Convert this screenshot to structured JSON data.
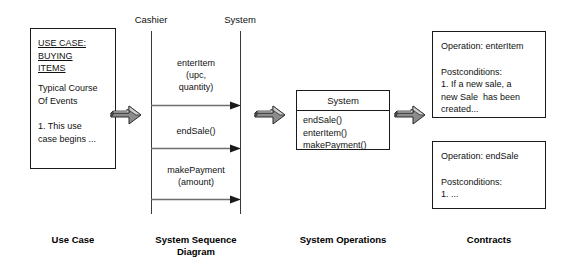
{
  "diagram": {
    "colors": {
      "stroke": "#1a1a1a",
      "lifeline": "#3a3a3a",
      "arrow_body": "#808080",
      "arrow_top": "#c8c8c8",
      "arrow_side": "#4d4d4d",
      "background": "#ffffff"
    }
  },
  "use_case": {
    "title_lines": "USE CASE:\nBUYING\nITEMS",
    "section_heading": "Typical Course\nOf Events",
    "body": "1. This use\ncase begins ...",
    "caption": "Use Case"
  },
  "sequence_diagram": {
    "caption": "System\nSequence\nDiagram",
    "participants": [
      {
        "name": "Cashier"
      },
      {
        "name": "System"
      }
    ],
    "messages": [
      {
        "label": "enterItem\n(upc,\nquantity)"
      },
      {
        "label": "endSale()"
      },
      {
        "label": "makePayment\n(amount)"
      }
    ]
  },
  "system_operations": {
    "class_name": "System",
    "operations": "endSale()\nenterItem()\nmakePayment()",
    "caption": "System\nOperations"
  },
  "contracts": {
    "caption": "Contracts",
    "items": [
      {
        "operation": "Operation: enterItem",
        "postconditions_heading": "Postconditions:",
        "postconditions_body": "1. If a new sale, a\nnew Sale  has been\ncreated..."
      },
      {
        "operation": "Operation: endSale",
        "postconditions_heading": "Postconditions:",
        "postconditions_body": "1. ..."
      }
    ]
  },
  "flow_arrows": [
    {
      "name": "arrow-usecase-to-ssd"
    },
    {
      "name": "arrow-ssd-to-operations"
    },
    {
      "name": "arrow-operations-to-contracts"
    }
  ]
}
